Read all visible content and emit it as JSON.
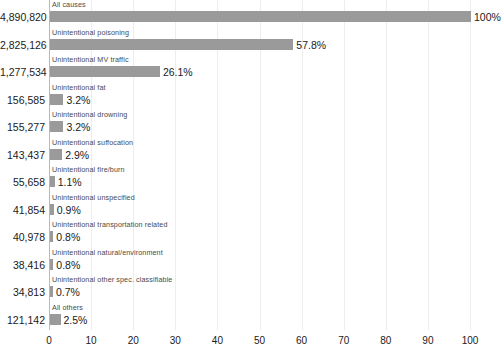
{
  "chart_data": {
    "type": "bar",
    "orientation": "horizontal",
    "title": "",
    "subtitle": "",
    "xlabel": "",
    "ylabel": "",
    "xlim": [
      0,
      100
    ],
    "xticks": [
      0,
      10,
      20,
      30,
      40,
      50,
      60,
      70,
      80,
      90,
      100
    ],
    "xtick_labels": [
      "0",
      "10",
      "20",
      "30",
      "40",
      "50",
      "60",
      "70",
      "80",
      "90",
      "100"
    ],
    "grid": true,
    "grid_axis": "x",
    "legend": false,
    "bar_color": "#9a9a9a",
    "categories": [
      "All causes",
      "Unintentional poisoning",
      "Unintentional MV traffic",
      "Unintentional fat",
      "Unintentional drowning",
      "Unintentional suffocation",
      "Unintentional fire/burn",
      "Unintentional unspecified",
      "Unintentional transportation related",
      "Unintentional natural/environment",
      "Unintentional other spec. classifiable",
      "All others"
    ],
    "values": [
      100.0,
      57.8,
      26.1,
      3.2,
      3.2,
      2.9,
      1.1,
      0.9,
      0.8,
      0.8,
      0.7,
      2.5
    ],
    "value_labels": [
      "100%",
      "57.8%",
      "26.1%",
      "3.2%",
      "3.2%",
      "2.9%",
      "1.1%",
      "0.9%",
      "0.8%",
      "0.8%",
      "0.7%",
      "2.5%"
    ],
    "counts": [
      "4,890,820",
      "2,825,126",
      "1,277,534",
      "156,585",
      "155,277",
      "143,437",
      "55,658",
      "41,854",
      "40,978",
      "38,416",
      "34,813",
      "121,142"
    ],
    "rows": [
      {
        "label": "All causes",
        "count": "4,890,820",
        "value": 100.0,
        "pct_label": "100%"
      },
      {
        "label": "Unintentional poisoning",
        "count": "2,825,126",
        "value": 57.8,
        "pct_label": "57.8%"
      },
      {
        "label": "Unintentional MV traffic",
        "count": "1,277,534",
        "value": 26.1,
        "pct_label": "26.1%"
      },
      {
        "label": "Unintentional fat",
        "count": "156,585",
        "value": 3.2,
        "pct_label": "3.2%"
      },
      {
        "label": "Unintentional drowning",
        "count": "155,277",
        "value": 3.2,
        "pct_label": "3.2%"
      },
      {
        "label": "Unintentional suffocation",
        "count": "143,437",
        "value": 2.9,
        "pct_label": "2.9%"
      },
      {
        "label": "Unintentional fire/burn",
        "count": "55,658",
        "value": 1.1,
        "pct_label": "1.1%"
      },
      {
        "label": "Unintentional unspecified",
        "count": "41,854",
        "value": 0.9,
        "pct_label": "0.9%"
      },
      {
        "label": "Unintentional transportation related",
        "count": "40,978",
        "value": 0.8,
        "pct_label": "0.8%"
      },
      {
        "label": "Unintentional natural/environment",
        "count": "38,416",
        "value": 0.8,
        "pct_label": "0.8%"
      },
      {
        "label": "Unintentional other spec. classifiable",
        "count": "34,813",
        "value": 0.7,
        "pct_label": "0.7%"
      },
      {
        "label": "All others",
        "count": "121,142",
        "value": 2.5,
        "pct_label": "2.5%"
      }
    ]
  }
}
